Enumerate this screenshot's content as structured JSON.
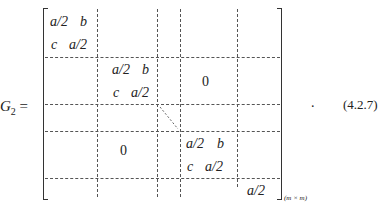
{
  "equation": {
    "lhs": "G",
    "lhs_subscript": "2",
    "equals": "=",
    "blocks": [
      {
        "id": "block-1",
        "r1c1": "a/2",
        "r1c2": "b",
        "r2c1": "c",
        "r2c2": "a/2"
      },
      {
        "id": "block-2",
        "r1c1": "a/2",
        "r1c2": "b",
        "r2c1": "c",
        "r2c2": "a/2"
      },
      {
        "id": "block-3",
        "r1c1": "a/2",
        "r1c2": "b",
        "r2c1": "c",
        "r2c2": "a/2"
      }
    ],
    "upper_zero": "0",
    "lower_zero": "0",
    "last_entry": "a/2",
    "size_subscript": "(m × m)",
    "trailing_period": ".",
    "equation_number": "(4.2.7)"
  }
}
